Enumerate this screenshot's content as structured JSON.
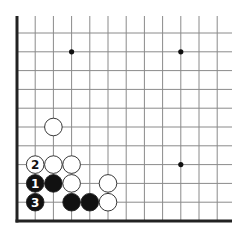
{
  "diagram": {
    "type": "go-board-corner",
    "corner": "bottom-left",
    "grid": {
      "columns": 12,
      "rows": 11,
      "origin_x": 17,
      "origin_y": 221,
      "spacing_x": 18.2,
      "spacing_y": 18.8,
      "line_extend_right": 232,
      "line_extend_top": 16,
      "line_color": "#8a8a8a",
      "edge_color": "#222222"
    },
    "star_points": [
      {
        "col": 3,
        "row": 9
      },
      {
        "col": 9,
        "row": 9
      },
      {
        "col": 9,
        "row": 3
      }
    ],
    "stones": [
      {
        "color": "white",
        "col": 2,
        "row": 5,
        "label": ""
      },
      {
        "color": "white",
        "col": 1,
        "row": 3,
        "label": "2"
      },
      {
        "color": "white",
        "col": 2,
        "row": 3,
        "label": ""
      },
      {
        "color": "white",
        "col": 3,
        "row": 3,
        "label": ""
      },
      {
        "color": "black",
        "col": 1,
        "row": 2,
        "label": "1"
      },
      {
        "color": "black",
        "col": 2,
        "row": 2,
        "label": ""
      },
      {
        "color": "white",
        "col": 3,
        "row": 2,
        "label": ""
      },
      {
        "color": "white",
        "col": 5,
        "row": 2,
        "label": ""
      },
      {
        "color": "black",
        "col": 1,
        "row": 1,
        "label": "3"
      },
      {
        "color": "black",
        "col": 3,
        "row": 1,
        "label": ""
      },
      {
        "color": "black",
        "col": 4,
        "row": 1,
        "label": ""
      },
      {
        "color": "white",
        "col": 5,
        "row": 1,
        "label": ""
      }
    ],
    "colors": {
      "black_stone": "#111111",
      "white_stone": "#ffffff",
      "stone_outline": "#222222"
    }
  }
}
